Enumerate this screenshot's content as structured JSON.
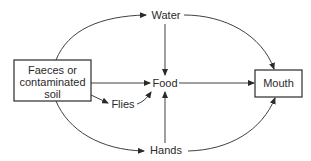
{
  "diagram": {
    "type": "flow",
    "nodes": {
      "source": {
        "line1": "Faeces or",
        "line2": "contaminated",
        "line3": "soil",
        "boxed": true
      },
      "water": {
        "label": "Water"
      },
      "food": {
        "label": "Food"
      },
      "flies": {
        "label": "Flies"
      },
      "hands": {
        "label": "Hands"
      },
      "mouth": {
        "label": "Mouth",
        "boxed": true
      }
    },
    "edges": [
      {
        "from": "Faeces or contaminated soil",
        "to": "Water"
      },
      {
        "from": "Faeces or contaminated soil",
        "to": "Food"
      },
      {
        "from": "Faeces or contaminated soil",
        "to": "Flies"
      },
      {
        "from": "Faeces or contaminated soil",
        "to": "Hands"
      },
      {
        "from": "Flies",
        "to": "Food"
      },
      {
        "from": "Water",
        "to": "Food"
      },
      {
        "from": "Hands",
        "to": "Food"
      },
      {
        "from": "Water",
        "to": "Mouth"
      },
      {
        "from": "Food",
        "to": "Mouth"
      },
      {
        "from": "Hands",
        "to": "Mouth"
      }
    ],
    "colors": {
      "stroke": "#2a2a2a",
      "background": "#ffffff"
    }
  }
}
